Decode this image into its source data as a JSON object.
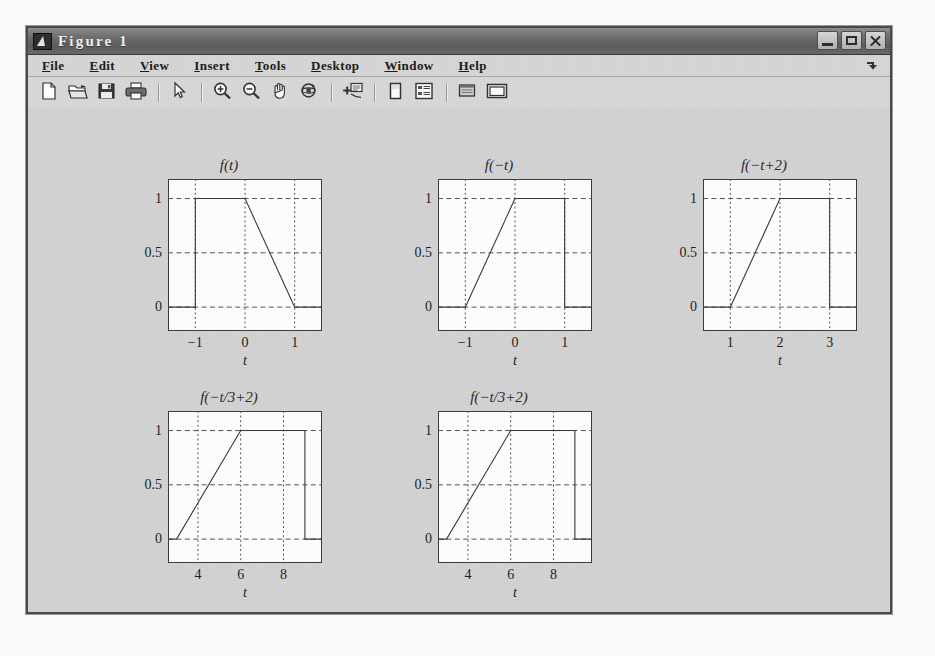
{
  "window": {
    "title": "Figure 1",
    "icon": "matlab-figure-icon",
    "buttons": [
      {
        "name": "minimize-button",
        "label": "Minimize"
      },
      {
        "name": "maximize-button",
        "label": "Maximize"
      },
      {
        "name": "close-button",
        "label": "Close"
      }
    ]
  },
  "menu": {
    "items": [
      {
        "label": "File",
        "mnemonic": "F"
      },
      {
        "label": "Edit",
        "mnemonic": "E"
      },
      {
        "label": "View",
        "mnemonic": "V"
      },
      {
        "label": "Insert",
        "mnemonic": "I"
      },
      {
        "label": "Tools",
        "mnemonic": "T"
      },
      {
        "label": "Desktop",
        "mnemonic": "D"
      },
      {
        "label": "Window",
        "mnemonic": "W"
      },
      {
        "label": "Help",
        "mnemonic": "H"
      }
    ],
    "overflow_icon": "menu-overflow-arrow-icon"
  },
  "toolbar": {
    "items": [
      {
        "name": "new-figure-icon",
        "tooltip": "New Figure"
      },
      {
        "name": "open-file-icon",
        "tooltip": "Open File"
      },
      {
        "name": "save-figure-icon",
        "tooltip": "Save Figure"
      },
      {
        "name": "print-figure-icon",
        "tooltip": "Print Figure"
      },
      {
        "name": "separator-1",
        "tooltip": ""
      },
      {
        "name": "pointer-arrow-icon",
        "tooltip": "Edit Plot"
      },
      {
        "name": "separator-2",
        "tooltip": ""
      },
      {
        "name": "zoom-in-icon",
        "tooltip": "Zoom In"
      },
      {
        "name": "zoom-out-icon",
        "tooltip": "Zoom Out"
      },
      {
        "name": "pan-hand-icon",
        "tooltip": "Pan"
      },
      {
        "name": "rotate-3d-icon",
        "tooltip": "Rotate 3D"
      },
      {
        "name": "separator-3",
        "tooltip": ""
      },
      {
        "name": "data-cursor-icon",
        "tooltip": "Data Cursor"
      },
      {
        "name": "separator-4",
        "tooltip": ""
      },
      {
        "name": "colorbar-icon",
        "tooltip": "Insert Colorbar"
      },
      {
        "name": "legend-icon",
        "tooltip": "Insert Legend"
      },
      {
        "name": "separator-5",
        "tooltip": ""
      },
      {
        "name": "plot-browser-icon",
        "tooltip": "Show Plot Tools"
      },
      {
        "name": "figure-palette-icon",
        "tooltip": "Hide Plot Tools"
      }
    ]
  },
  "chart_data": [
    {
      "type": "line",
      "title": "f(t)",
      "xlabel": "t",
      "ylabel": "",
      "xlim": [
        -1.55,
        1.55
      ],
      "ylim": [
        -0.22,
        1.18
      ],
      "xticks": [
        -1,
        0,
        1
      ],
      "xtick_labels": [
        "−1",
        "0",
        "1"
      ],
      "yticks": [
        0,
        0.5,
        1
      ],
      "ytick_labels": [
        "0",
        "0.5",
        "1"
      ],
      "grid": true,
      "series": [
        {
          "name": "f(t)",
          "x": [
            -1.55,
            -1,
            -1,
            0,
            1,
            1,
            1.55
          ],
          "y": [
            0,
            0,
            1,
            1,
            0,
            0,
            0
          ]
        }
      ]
    },
    {
      "type": "line",
      "title": "f(−t)",
      "xlabel": "t",
      "ylabel": "",
      "xlim": [
        -1.55,
        1.55
      ],
      "ylim": [
        -0.22,
        1.18
      ],
      "xticks": [
        -1,
        0,
        1
      ],
      "xtick_labels": [
        "−1",
        "0",
        "1"
      ],
      "yticks": [
        0,
        0.5,
        1
      ],
      "ytick_labels": [
        "0",
        "0.5",
        "1"
      ],
      "grid": true,
      "series": [
        {
          "name": "f(-t)",
          "x": [
            -1.55,
            -1,
            0,
            1,
            1,
            1.55
          ],
          "y": [
            0,
            0,
            1,
            1,
            0,
            0
          ]
        }
      ]
    },
    {
      "type": "line",
      "title": "f(−t+2)",
      "xlabel": "t",
      "ylabel": "",
      "xlim": [
        0.45,
        3.55
      ],
      "ylim": [
        -0.22,
        1.18
      ],
      "xticks": [
        1,
        2,
        3
      ],
      "xtick_labels": [
        "1",
        "2",
        "3"
      ],
      "yticks": [
        0,
        0.5,
        1
      ],
      "ytick_labels": [
        "0",
        "0.5",
        "1"
      ],
      "grid": true,
      "series": [
        {
          "name": "f(-t+2)",
          "x": [
            0.45,
            1,
            2,
            3,
            3,
            3.55
          ],
          "y": [
            0,
            0,
            1,
            1,
            0,
            0
          ]
        }
      ]
    },
    {
      "type": "line",
      "title": "f(−t/3+2)",
      "xlabel": "t",
      "ylabel": "",
      "xlim": [
        2.6,
        9.8
      ],
      "ylim": [
        -0.22,
        1.18
      ],
      "xticks": [
        4,
        6,
        8
      ],
      "xtick_labels": [
        "4",
        "6",
        "8"
      ],
      "yticks": [
        0,
        0.5,
        1
      ],
      "ytick_labels": [
        "0",
        "0.5",
        "1"
      ],
      "grid": true,
      "series": [
        {
          "name": "f(-t/3+2)",
          "x": [
            2.6,
            3,
            6,
            9,
            9,
            9.8
          ],
          "y": [
            0,
            0,
            1,
            1,
            0,
            0
          ]
        }
      ]
    },
    {
      "type": "line",
      "title": "f(−t/3+2)",
      "xlabel": "t",
      "ylabel": "",
      "xlim": [
        2.6,
        9.8
      ],
      "ylim": [
        -0.22,
        1.18
      ],
      "xticks": [
        4,
        6,
        8
      ],
      "xtick_labels": [
        "4",
        "6",
        "8"
      ],
      "yticks": [
        0,
        0.5,
        1
      ],
      "ytick_labels": [
        "0",
        "0.5",
        "1"
      ],
      "grid": true,
      "series": [
        {
          "name": "f(-t/3+2)",
          "x": [
            2.6,
            3,
            6,
            9,
            9,
            9.8
          ],
          "y": [
            0,
            0,
            1,
            1,
            0,
            0
          ]
        }
      ]
    }
  ],
  "layout": {
    "plot_positions": [
      {
        "left": 100,
        "top": 50
      },
      {
        "left": 370,
        "top": 50
      },
      {
        "left": 635,
        "top": 50
      },
      {
        "left": 100,
        "top": 282
      },
      {
        "left": 370,
        "top": 282
      }
    ]
  },
  "colors": {
    "figure_background": "#d4d4d4",
    "axes_background": "#ffffff",
    "axes_line": "#3d3d3d",
    "grid_line": "#555555",
    "data_line": "#3a3a3a",
    "titlebar": "#6f6f6f",
    "menubar": "#d7d7d7"
  }
}
